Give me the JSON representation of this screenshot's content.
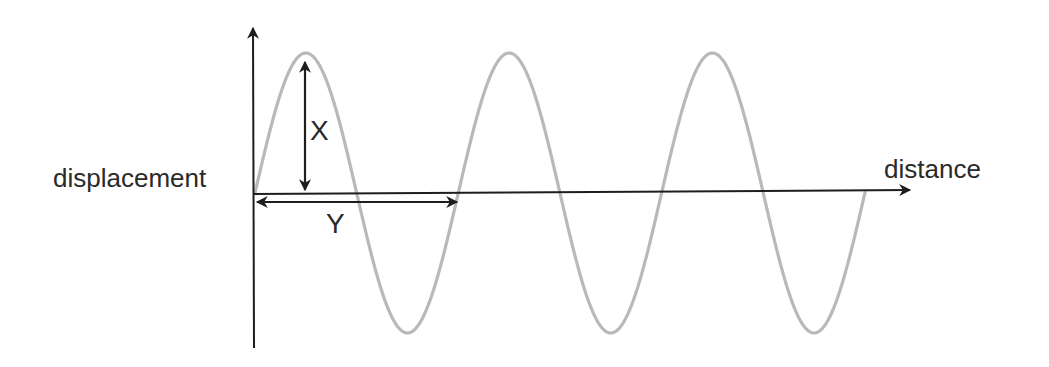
{
  "diagram": {
    "labels": {
      "y_axis": "displacement",
      "x_axis": "distance",
      "amplitude": "X",
      "wavelength": "Y"
    },
    "colors": {
      "background": "#ffffff",
      "axis": "#1e1e1e",
      "wave": "#b9b9b9",
      "text": "#2a2a2a"
    },
    "geometry": {
      "origin_x": 255,
      "origin_y": 193,
      "y_axis_top": 28,
      "y_axis_bottom": 348,
      "x_axis_end_x": 910,
      "x_axis_end_y": 190,
      "wave_start_x": 255,
      "wave_end_x": 865,
      "amplitude_px": 140,
      "wavelength_px": 203.3,
      "cycles": 3,
      "amplitude_arrow_x": 305,
      "amplitude_arrow_top": 62,
      "amplitude_arrow_bottom": 190,
      "wavelength_arrow_y": 202,
      "wavelength_arrow_start_x": 257,
      "wavelength_arrow_end_x": 457
    }
  }
}
